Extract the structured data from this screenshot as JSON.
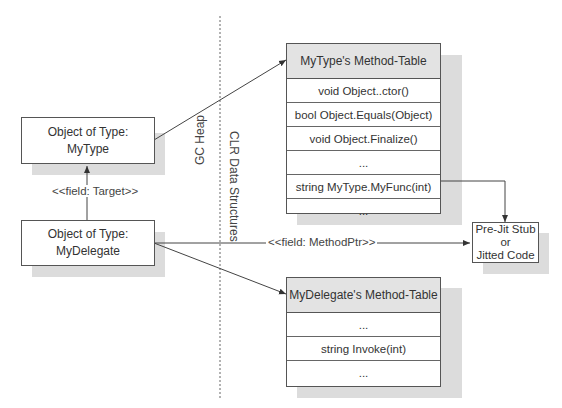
{
  "gc_heap": {
    "region_label": "GC Heap",
    "mytype_object": {
      "line1": "Object of Type:",
      "line2": "MyType"
    },
    "delegate_object": {
      "line1": "Object of Type:",
      "line2": "MyDelegate"
    },
    "target_field_label": "<<field: Target>>"
  },
  "clr": {
    "region_label": "CLR Data Structures",
    "mytype_method_table": {
      "title": "MyType's Method-Table",
      "rows": [
        "void Object..ctor()",
        "bool Object.Equals(Object)",
        "void Object.Finalize()",
        "...",
        "string MyType.MyFunc(int)",
        "..."
      ]
    },
    "delegate_method_table": {
      "title": "MyDelegate's Method-Table",
      "rows": [
        "...",
        "string Invoke(int)",
        "..."
      ]
    }
  },
  "code_box": {
    "line1": "Pre-Jit Stub",
    "line2": "or",
    "line3": "Jitted Code"
  },
  "method_ptr_label": "<<field: MethodPtr>>"
}
